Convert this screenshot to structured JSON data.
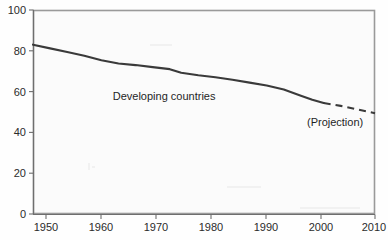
{
  "chart_data": {
    "type": "line",
    "title": "",
    "xlabel": "",
    "ylabel": "",
    "xlim": [
      1950,
      2010
    ],
    "ylim": [
      0,
      100
    ],
    "grid": false,
    "legend": "none",
    "xticks": [
      "1950",
      "1960",
      "1970",
      "1980",
      "1990",
      "2000",
      "2010"
    ],
    "yticks": [
      "0",
      "20",
      "40",
      "60",
      "80",
      "100"
    ],
    "series": [
      {
        "name": "Developing countries",
        "style": "solid",
        "x": [
          1950,
          1953,
          1956,
          1959,
          1962,
          1965,
          1968,
          1971,
          1974,
          1976,
          1979,
          1982,
          1985,
          1988,
          1991,
          1994,
          1997,
          1999,
          2001
        ],
        "values": [
          83.0,
          81.2,
          79.4,
          77.6,
          75.4,
          73.8,
          73.0,
          72.0,
          71.0,
          69.2,
          68.0,
          67.0,
          65.8,
          64.4,
          63.0,
          61.0,
          58.0,
          56.0,
          54.4
        ]
      },
      {
        "name": "Projection",
        "style": "dashed",
        "x": [
          2001,
          2004,
          2007,
          2010
        ],
        "values": [
          54.4,
          53.0,
          51.2,
          49.4
        ]
      }
    ],
    "annotations": [
      {
        "text": "Developing countries",
        "x": 1973,
        "y": 56
      },
      {
        "text": "(Projection)",
        "x": 2003,
        "y": 43
      }
    ]
  },
  "labels": {
    "series_label": "Developing countries",
    "projection_label": "(Projection)",
    "y_0": "0",
    "y_20": "20",
    "y_40": "40",
    "y_60": "60",
    "y_80": "80",
    "y_100": "100",
    "x_1950": "1950",
    "x_1960": "1960",
    "x_1970": "1970",
    "x_1980": "1980",
    "x_1990": "1990",
    "x_2000": "2000",
    "x_2010": "2010"
  },
  "colors": {
    "line": "#3a3a3a",
    "axis": "#6e6e6e",
    "border": "#9a9a9a",
    "plot_background": "#fbfbfb",
    "page_background": "#fefefe",
    "text": "#2b2b2b"
  }
}
